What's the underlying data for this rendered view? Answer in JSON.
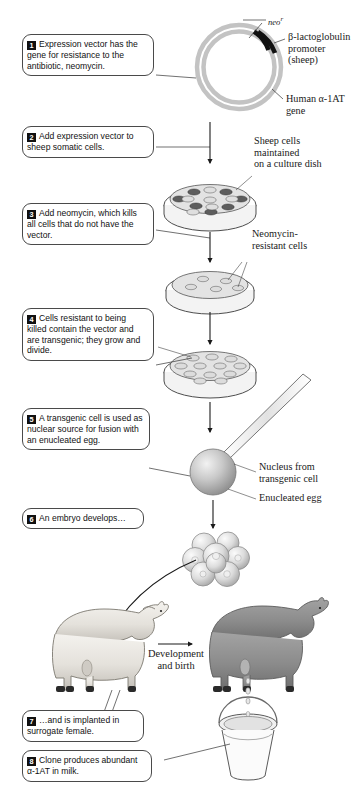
{
  "figure": {
    "accent_dark": "#1a1a1a",
    "accent_gray": "#9a9a9a",
    "sheep_light": "#e8e6e2",
    "sheep_dark": "#8a8a8a"
  },
  "steps": [
    {
      "number": "1",
      "text": "Expression vector has the gene for resistance to the antibiotic, neomycin."
    },
    {
      "number": "2",
      "text": "Add expression vector to sheep somatic cells."
    },
    {
      "number": "3",
      "text": "Add neomycin, which kills all cells that do not have the vector."
    },
    {
      "number": "4",
      "text": "Cells resistant to being killed contain the vector and are transgenic; they grow and divide."
    },
    {
      "number": "5",
      "text": "A transgenic cell is used as nuclear source for fusion with an enucleated egg."
    },
    {
      "number": "6",
      "text": "An embryo develops…"
    },
    {
      "number": "7",
      "text": "…and is implanted in surrogate female."
    },
    {
      "number": "8",
      "text": "Clone produces abundant α-1AT in milk."
    }
  ],
  "labels": {
    "neo": "neo",
    "neo_superscript": "r",
    "promoter": "β-lactoglobulin\npromoter (sheep)",
    "a1at_gene": "Human α-1AT\ngene",
    "culture_dish": "Sheep cells\nmaintained\non a culture dish",
    "neomycin_resistant": "Neomycin-\nresistant cells",
    "nucleus_from": "Nucleus from\ntransgenic cell",
    "enucleated_egg": "Enucleated egg",
    "development_birth": "Development\nand birth"
  },
  "icons": {
    "plasmid": "plasmid-ring-icon",
    "dish": "petri-dish-icon",
    "egg": "egg-cell-icon",
    "pipette": "micropipette-icon",
    "embryo": "embryo-cluster-icon",
    "sheep_surrogate": "sheep-light-icon",
    "sheep_clone": "sheep-dark-icon",
    "bucket": "milk-bucket-icon",
    "arrow": "arrow-down-icon"
  }
}
